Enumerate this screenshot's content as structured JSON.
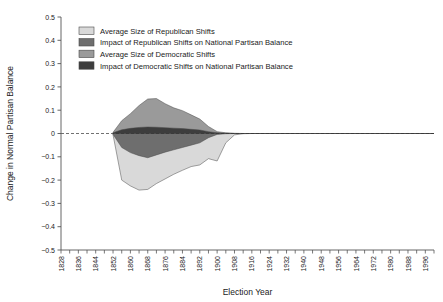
{
  "chart_data": {
    "type": "area",
    "title": "",
    "xlabel": "Election Year",
    "ylabel": "Change in Normal Partisan Balance",
    "xlim": [
      1828,
      2000
    ],
    "ylim": [
      -0.5,
      0.5
    ],
    "grid": false,
    "legend_position": "top-left",
    "zero_line": true,
    "y_ticks": [
      "0.5",
      "0.4",
      "0.3",
      "0.2",
      "0.1",
      "0",
      "−0.1",
      "−0.2",
      "−0.3",
      "−0.4",
      "−0.5"
    ],
    "y_tick_values": [
      0.5,
      0.4,
      0.3,
      0.2,
      0.1,
      0,
      -0.1,
      -0.2,
      -0.3,
      -0.4,
      -0.5
    ],
    "x_ticks": [
      "1828",
      "1836",
      "1844",
      "1852",
      "1860",
      "1868",
      "1876",
      "1884",
      "1892",
      "1900",
      "1908",
      "1916",
      "1924",
      "1932",
      "1940",
      "1948",
      "1956",
      "1964",
      "1972",
      "1980",
      "1988",
      "1996"
    ],
    "x_tick_values": [
      1828,
      1836,
      1844,
      1852,
      1860,
      1868,
      1876,
      1884,
      1892,
      1900,
      1908,
      1916,
      1924,
      1932,
      1940,
      1948,
      1956,
      1964,
      1972,
      1980,
      1988,
      1996
    ],
    "x_minor_step": 4,
    "x": [
      1852,
      1856,
      1860,
      1864,
      1868,
      1872,
      1876,
      1880,
      1884,
      1888,
      1892,
      1896,
      1900,
      1904,
      1908,
      1912,
      1916,
      1920,
      1924,
      1928,
      1932,
      1936,
      1940,
      1944,
      1948,
      1952,
      1956,
      1960,
      1964,
      1968,
      1972,
      1976,
      1980,
      1984,
      1988,
      1992,
      1996,
      2000
    ],
    "series": [
      {
        "name": "Average Size of Democratic Shifts",
        "color": "#9a9a9a",
        "values": [
          0.005,
          0.055,
          0.085,
          0.12,
          0.148,
          0.15,
          0.128,
          0.11,
          0.098,
          0.08,
          0.062,
          0.03,
          0.008,
          0.003,
          0.001,
          0,
          0,
          0,
          0,
          0,
          0,
          0,
          0,
          0,
          0,
          0,
          0,
          0,
          0,
          0,
          0,
          0,
          0,
          0,
          0,
          0,
          0,
          0
        ]
      },
      {
        "name": "Impact of Democratic Shifts on National Partisan Balance",
        "color": "#3d3d3d",
        "values": [
          0.003,
          0.016,
          0.022,
          0.026,
          0.028,
          0.027,
          0.025,
          0.023,
          0.021,
          0.018,
          0.015,
          0.008,
          0.003,
          0.001,
          0,
          0,
          0,
          0,
          0,
          0,
          0,
          0,
          0,
          0,
          0,
          0,
          0,
          0,
          0,
          0,
          0,
          0,
          0,
          0,
          0,
          0,
          0,
          0
        ]
      },
      {
        "name": "Impact of Republican Shifts on National Partisan Balance",
        "color": "#6e6e6e",
        "values": [
          -0.004,
          -0.06,
          -0.082,
          -0.095,
          -0.104,
          -0.092,
          -0.08,
          -0.07,
          -0.06,
          -0.05,
          -0.04,
          -0.018,
          -0.004,
          -0.001,
          0,
          0,
          0,
          0,
          0,
          0,
          0,
          0,
          0,
          0,
          0,
          0,
          0,
          0,
          0,
          0,
          0,
          0,
          0,
          0,
          0,
          0,
          0,
          0
        ]
      },
      {
        "name": "Average Size of Republican Shifts",
        "color": "#d9d9d9",
        "values": [
          -0.006,
          -0.2,
          -0.225,
          -0.243,
          -0.24,
          -0.215,
          -0.195,
          -0.175,
          -0.158,
          -0.142,
          -0.135,
          -0.108,
          -0.118,
          -0.04,
          -0.006,
          -0.001,
          0,
          0,
          0,
          0,
          0,
          0,
          0,
          0,
          0,
          0,
          0,
          0,
          0,
          0,
          0,
          0,
          0,
          0,
          0,
          0,
          0,
          0
        ]
      }
    ]
  },
  "legend": {
    "items": [
      {
        "label": "Average Size of Republican Shifts",
        "color": "#d9d9d9"
      },
      {
        "label": "Impact of Republican Shifts on National Partisan Balance",
        "color": "#6e6e6e"
      },
      {
        "label": "Average Size of Democratic Shifts",
        "color": "#9a9a9a"
      },
      {
        "label": "Impact of Democratic Shifts on National Partisan Balance",
        "color": "#3d3d3d"
      }
    ]
  },
  "axes": {
    "y_title": "Change in Normal Partisan Balance",
    "x_title": "Election Year"
  }
}
